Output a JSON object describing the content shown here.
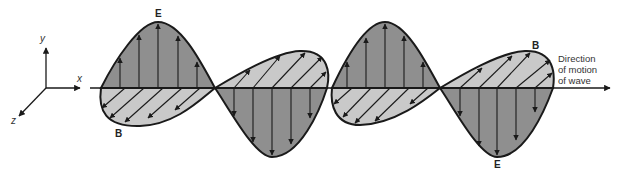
{
  "diagram": {
    "axes": {
      "x_label": "x",
      "y_label": "y",
      "z_label": "z"
    },
    "field_labels": {
      "E_top": "E",
      "E_bottom": "E",
      "B_left": "B",
      "B_right": "B"
    },
    "direction_label": [
      "Direction",
      "of motion",
      "of wave"
    ],
    "colors": {
      "e_fill": "#8f8f8f",
      "b_fill": "#c9c9c9",
      "stroke": "#1a1a1a",
      "background": "#ffffff"
    }
  }
}
